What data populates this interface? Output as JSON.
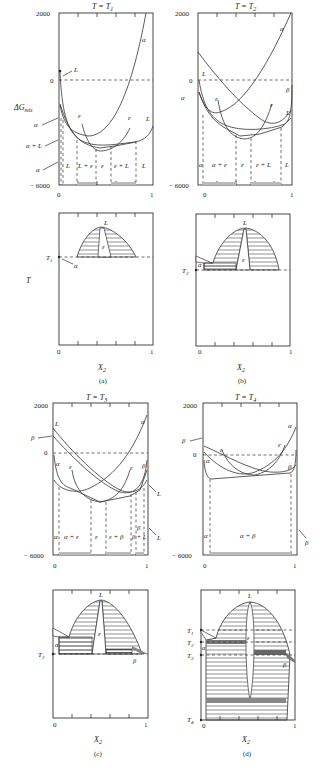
{
  "figure": {
    "panels": [
      {
        "id": "a",
        "caption": "(a)",
        "top": {
          "title": "T = T",
          "title_sub": "1",
          "y_ticks": [
            "2000",
            "0",
            "− 6000"
          ],
          "y_label": "ΔG",
          "y_label_sub": "mix",
          "x_ticks": [
            "0",
            "1"
          ],
          "curve_labels": [
            "α",
            "L",
            "ε",
            "ε",
            "L"
          ],
          "side_labels": [
            "L",
            "α",
            "α + L",
            "α"
          ],
          "region_labels": [
            "L",
            "L + ε",
            "ε",
            "ε + L",
            "L"
          ]
        },
        "bottom": {
          "y_label": "T",
          "temp_label": "T",
          "temp_sub": "1",
          "phase_labels": [
            "L",
            "ε",
            "α"
          ],
          "x_ticks": [
            "0",
            "1"
          ],
          "x_label": "X",
          "x_label_sub": "2"
        }
      },
      {
        "id": "b",
        "caption": "(b)",
        "top": {
          "title": "T = T",
          "title_sub": "2",
          "y_ticks": [
            "2000",
            "0",
            "− 6000"
          ],
          "x_ticks": [
            "0",
            "1"
          ],
          "curve_labels": [
            "α",
            "L",
            "β",
            "α",
            "ε",
            "ε",
            "L"
          ],
          "region_labels": [
            "α",
            "α + ε",
            "ε",
            "ε + L",
            "L"
          ]
        },
        "bottom": {
          "temp_label": "T",
          "temp_sub": "2",
          "phase_labels": [
            "L",
            "ε",
            "α"
          ],
          "x_ticks": [
            "0",
            "1"
          ],
          "x_label": "X",
          "x_label_sub": "2"
        }
      },
      {
        "id": "c",
        "caption": "(c)",
        "top": {
          "title": "T = T",
          "title_sub": "3",
          "y_ticks": [
            "2000",
            "0",
            "− 6000"
          ],
          "x_ticks": [
            "0",
            "1"
          ],
          "curve_labels": [
            "α",
            "L",
            "β",
            "α",
            "ε",
            "ε",
            "β"
          ],
          "side_labels": [
            "L",
            "L"
          ],
          "region_labels": [
            "α",
            "α + ε",
            "ε",
            "ε + β",
            "β + L",
            "β"
          ]
        },
        "bottom": {
          "temp_label": "T",
          "temp_sub": "3",
          "phase_labels": [
            "L",
            "ε",
            "α",
            "β"
          ],
          "x_ticks": [
            "0",
            "1"
          ],
          "x_label": "X",
          "x_label_sub": "2"
        }
      },
      {
        "id": "d",
        "caption": "(d)",
        "top": {
          "title": "T = T",
          "title_sub": "4",
          "y_ticks": [
            "2000",
            "0",
            "− 6000"
          ],
          "x_ticks": [
            "0",
            "1"
          ],
          "curve_labels": [
            "α",
            "ε",
            "β",
            "α",
            "ε",
            "β"
          ],
          "side_labels": [
            "β"
          ],
          "region_labels": [
            "α",
            "α + β"
          ]
        },
        "bottom": {
          "temp_labels": [
            {
              "t": "T",
              "s": "1"
            },
            {
              "t": "T",
              "s": "2"
            },
            {
              "t": "T",
              "s": "3"
            },
            {
              "t": "T",
              "s": "4"
            }
          ],
          "phase_labels": [
            "L",
            "ε",
            "α",
            "β"
          ],
          "x_ticks": [
            "0",
            "1"
          ],
          "x_label": "X",
          "x_label_sub": "2"
        }
      }
    ]
  }
}
